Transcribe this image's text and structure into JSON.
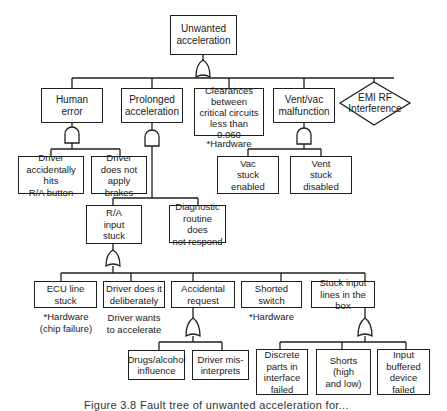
{
  "diagram": {
    "type": "fault-tree",
    "top_event": {
      "id": "top",
      "label": "Unwanted\nacceleration",
      "gate": "OR"
    },
    "level1": [
      {
        "id": "human",
        "label": "Human\nerror",
        "gate": "AND"
      },
      {
        "id": "prolonged",
        "label": "Prolonged\nacceleration",
        "gate": "AND"
      },
      {
        "id": "clearances",
        "label": "Clearances\nbetween\ncritical circuits\nless than 0.060",
        "note": "*Hardware"
      },
      {
        "id": "ventvac",
        "label": "Vent/vac\nmalfunction",
        "gate": "AND"
      },
      {
        "id": "emi",
        "label": "EMI RF\nInterference",
        "shape": "diamond"
      }
    ],
    "level2": [
      {
        "id": "driver_hits",
        "parent": "human",
        "label": "Driver\naccidentally hits\nR/A button"
      },
      {
        "id": "driver_brakes",
        "parent": "human",
        "label": "Driver\ndoes not\napply brakes"
      },
      {
        "id": "vac_stuck",
        "parent": "ventvac",
        "label": "Vac\nstuck\nenabled"
      },
      {
        "id": "vent_stuck",
        "parent": "ventvac",
        "label": "Vent\nstuck\ndisabled"
      }
    ],
    "level3": [
      {
        "id": "ra_input",
        "parent": "prolonged",
        "label": "R/A\ninput\nstuck",
        "gate": "OR"
      },
      {
        "id": "diagnostic",
        "parent": "prolonged",
        "label": "Diagnostic\nroutine does\nnot respond"
      }
    ],
    "level4": [
      {
        "id": "ecu",
        "parent": "ra_input",
        "label": "ECU line\nstuck",
        "note": "*Hardware\n(chip failure)"
      },
      {
        "id": "deliberate",
        "parent": "ra_input",
        "label": "Driver does it\ndeliberately",
        "note": "Driver wants\nto accelerate"
      },
      {
        "id": "accidental",
        "parent": "ra_input",
        "label": "Accidental\nrequest",
        "gate": "OR"
      },
      {
        "id": "shorted",
        "parent": "ra_input",
        "label": "Shorted\nswitch",
        "note": "*Hardware"
      },
      {
        "id": "stuck_lines",
        "parent": "ra_input",
        "label": "Stuck input\nlines in the box",
        "gate": "OR"
      }
    ],
    "level5": [
      {
        "id": "drugs",
        "parent": "accidental",
        "label": "Drugs/alcohol\ninfluence"
      },
      {
        "id": "misinterprets",
        "parent": "accidental",
        "label": "Driver mis-\ninterprets"
      },
      {
        "id": "discrete",
        "parent": "stuck_lines",
        "label": "Discrete\nparts in\ninterface\nfailed"
      },
      {
        "id": "shorts",
        "parent": "stuck_lines",
        "label": "Shorts (high\nand low)"
      },
      {
        "id": "input_buffered",
        "parent": "stuck_lines",
        "label": "Input\nbuffered\ndevice\nfailed"
      }
    ],
    "caption": "Figure 3.8  Fault tree of unwanted acceleration for..."
  },
  "colors": {
    "line": "#1f1f1f",
    "background": "#ffffff"
  }
}
